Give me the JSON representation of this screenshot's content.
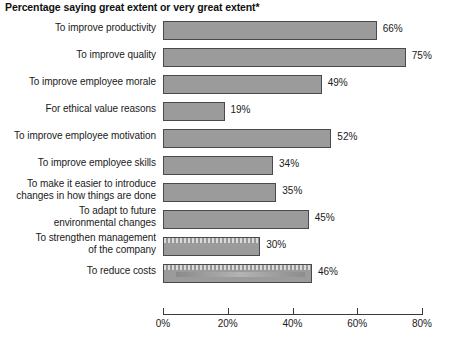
{
  "chart_data": {
    "type": "bar",
    "orientation": "horizontal",
    "title": "Percentage saying great extent or very great extent*",
    "xlabel": "",
    "ylabel": "",
    "xlim": [
      0,
      80
    ],
    "grid": false,
    "legend": null,
    "tick_labels": [
      "0%",
      "20%",
      "40%",
      "60%",
      "80%"
    ],
    "tick_values": [
      0,
      20,
      40,
      60,
      80
    ],
    "categories": [
      "To improve productivity",
      "To improve quality",
      "To improve employee morale",
      "For ethical value reasons",
      "To improve employee motivation",
      "To improve employee skills",
      "To make it easier to introduce changes in how things are done",
      "To adapt to future environmental changes",
      "To strengthen management of the company",
      "To reduce costs"
    ],
    "category_lines": [
      [
        "To improve productivity"
      ],
      [
        "To improve quality"
      ],
      [
        "To improve employee morale"
      ],
      [
        "For ethical value reasons"
      ],
      [
        "To improve employee motivation"
      ],
      [
        "To improve employee skills"
      ],
      [
        "To make it easier to introduce",
        "changes in how things are done"
      ],
      [
        "To adapt to future",
        "environmental changes"
      ],
      [
        "To strengthen management",
        "of the company"
      ],
      [
        "To reduce costs"
      ]
    ],
    "values": [
      66,
      75,
      49,
      19,
      52,
      34,
      35,
      45,
      30,
      46
    ],
    "value_labels": [
      "66%",
      "75%",
      "49%",
      "19%",
      "52%",
      "34%",
      "35%",
      "45%",
      "30%",
      "46%"
    ],
    "colors": {
      "bar_fill": "#9b9b9b",
      "bar_border": "#4a4a4a",
      "text": "#1a1a1a",
      "axis": "#3a3a3a",
      "background": "#ffffff"
    }
  }
}
